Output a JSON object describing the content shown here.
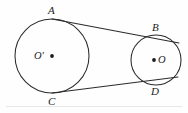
{
  "figure": {
    "kind": "geometry-diagram",
    "background_color": "#fefefe",
    "stroke_color": "#2b2b2b",
    "label_color": "#1c1c1c",
    "rule_color": "#e8e8e8"
  },
  "circles": [
    {
      "id": "left-circle",
      "center_label": "O'",
      "cx": 52,
      "cy": 56,
      "r": 37
    },
    {
      "id": "right-circle",
      "center_label": "O",
      "cx": 156,
      "cy": 60,
      "r": 25
    }
  ],
  "points": [
    {
      "id": "A",
      "label": "A",
      "x": 52,
      "y": 19,
      "label_x": 48,
      "label_y": 5
    },
    {
      "id": "B",
      "label": "B",
      "x": 157,
      "y": 38,
      "label_x": 152,
      "label_y": 22
    },
    {
      "id": "C",
      "label": "C",
      "x": 52,
      "y": 93,
      "label_x": 48,
      "label_y": 96
    },
    {
      "id": "D",
      "label": "D",
      "x": 156,
      "y": 83,
      "label_x": 151,
      "label_y": 86
    }
  ],
  "tangents": [
    {
      "id": "upper-tangent",
      "from": "A",
      "to": "B",
      "x1": 52,
      "y1": 19,
      "x2": 179,
      "y2": 43
    },
    {
      "id": "lower-tangent",
      "from": "C",
      "to": "D",
      "x1": 52,
      "y1": 93,
      "x2": 178,
      "y2": 77
    }
  ],
  "center_marks": [
    {
      "id": "left-center-dot",
      "cx": 52,
      "cy": 56,
      "r": 1.9
    },
    {
      "id": "right-center-dot",
      "cx": 154,
      "cy": 60,
      "r": 1.9
    }
  ],
  "center_labels": [
    {
      "id": "left-center-label",
      "text": "O'",
      "x": 34,
      "y": 51
    },
    {
      "id": "right-center-label",
      "text": "O",
      "x": 158,
      "y": 55
    }
  ],
  "baseline_rule": {
    "x1": 6,
    "y1": 106.5,
    "x2": 182,
    "y2": 106.5
  }
}
